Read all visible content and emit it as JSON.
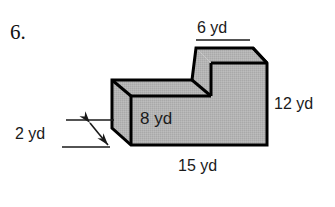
{
  "problem": {
    "number": "6."
  },
  "figure": {
    "name": "l-shaped-rectangular-prism",
    "shape_type": "composite rectangular prism (L-shaped step solid)",
    "face_fill_color": "#b3b3b3",
    "edge_color": "#000000",
    "background_color": "#ffffff"
  },
  "labels": {
    "top": "6 yd",
    "right": "12 yd",
    "front": "8 yd",
    "bottom": "15 yd",
    "depth": "2 yd"
  },
  "dimensions": [
    {
      "name": "top-step-width",
      "value": "6 yd"
    },
    {
      "name": "right-height",
      "value": "12 yd"
    },
    {
      "name": "front-lower-height",
      "value": "8 yd"
    },
    {
      "name": "base-width",
      "value": "15 yd"
    },
    {
      "name": "depth",
      "value": "2 yd"
    }
  ],
  "icons": {
    "depth_arrow": "double-headed-arrow-icon"
  }
}
